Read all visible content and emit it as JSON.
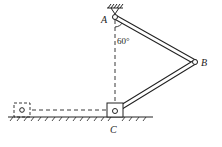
{
  "diagram": {
    "points": {
      "A": "A",
      "B": "B",
      "C": "C"
    },
    "angle_label": "60°",
    "colors": {
      "stroke": "#222222",
      "background": "#ffffff"
    }
  }
}
